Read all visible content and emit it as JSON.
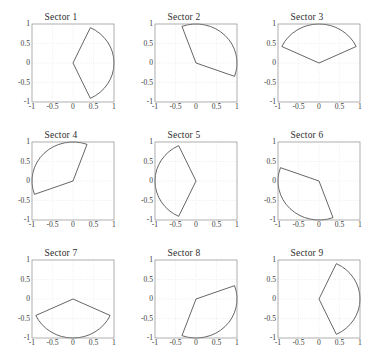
{
  "figure": {
    "background_color": "#ffffff",
    "axis_color": "#8c8c8c",
    "grid_color": "#cfcfcf",
    "curve_color": "#333333",
    "tick_label_color": "#3c3c3c",
    "rows": 3,
    "cols": 3
  },
  "axis": {
    "xticks": [
      "-1",
      "-0.5",
      "0",
      "0.5",
      "1"
    ],
    "yticks": [
      "1",
      "0.5",
      "0",
      "-0.5",
      "-1"
    ],
    "xlim": [
      -1,
      1
    ],
    "ylim": [
      -1,
      1
    ],
    "grid": true
  },
  "chart_data": {
    "type": "line",
    "title": "",
    "xlabel": "",
    "ylabel": "",
    "xlim": [
      -1,
      1
    ],
    "ylim": [
      -1,
      1
    ],
    "grid": true,
    "xticks": [
      -1,
      -0.5,
      0,
      0.5,
      1
    ],
    "yticks": [
      -1,
      -0.5,
      0,
      0.5,
      1
    ],
    "panels": [
      {
        "title": "Sector 1",
        "apex": [
          0,
          0
        ],
        "radius": 1,
        "start_angle_deg": -65,
        "end_angle_deg": 65,
        "arc_end_points": [
          [
            0.42,
            0.91
          ],
          [
            0.42,
            -0.91
          ]
        ],
        "values": [
          [
            0,
            0
          ],
          [
            0.42,
            0.91
          ],
          [
            1,
            0
          ],
          [
            0.42,
            -0.91
          ],
          [
            0,
            0
          ]
        ]
      },
      {
        "title": "Sector 2",
        "apex": [
          0,
          0
        ],
        "radius": 1,
        "start_angle_deg": -20,
        "end_angle_deg": 110,
        "arc_end_points": [
          [
            0.94,
            -0.34
          ],
          [
            -0.34,
            0.94
          ]
        ],
        "values": [
          [
            0,
            0
          ],
          [
            -0.34,
            0.94
          ],
          [
            0.5,
            0.87
          ],
          [
            0.94,
            -0.34
          ],
          [
            0,
            0
          ]
        ]
      },
      {
        "title": "Sector 3",
        "apex": [
          0,
          0
        ],
        "radius": 1,
        "start_angle_deg": 25,
        "end_angle_deg": 155,
        "arc_end_points": [
          [
            0.91,
            0.42
          ],
          [
            -0.91,
            0.42
          ]
        ],
        "values": [
          [
            0,
            0
          ],
          [
            0.91,
            0.42
          ],
          [
            0,
            1
          ],
          [
            -0.91,
            0.42
          ],
          [
            0,
            0
          ]
        ]
      },
      {
        "title": "Sector 4",
        "apex": [
          0,
          0
        ],
        "radius": 1,
        "start_angle_deg": 70,
        "end_angle_deg": 200,
        "arc_end_points": [
          [
            0.34,
            0.94
          ],
          [
            -0.94,
            -0.34
          ]
        ],
        "values": [
          [
            0,
            0
          ],
          [
            0.34,
            0.94
          ],
          [
            -0.5,
            0.87
          ],
          [
            -0.94,
            -0.34
          ],
          [
            0,
            0
          ]
        ]
      },
      {
        "title": "Sector 5",
        "apex": [
          0,
          0
        ],
        "radius": 1,
        "start_angle_deg": 115,
        "end_angle_deg": 245,
        "arc_end_points": [
          [
            -0.42,
            0.91
          ],
          [
            -0.42,
            -0.91
          ]
        ],
        "values": [
          [
            0,
            0
          ],
          [
            -0.42,
            0.91
          ],
          [
            -1,
            0
          ],
          [
            -0.42,
            -0.91
          ],
          [
            0,
            0
          ]
        ]
      },
      {
        "title": "Sector 6",
        "apex": [
          0,
          0
        ],
        "radius": 1,
        "start_angle_deg": 160,
        "end_angle_deg": 290,
        "arc_end_points": [
          [
            -0.94,
            0.34
          ],
          [
            0.34,
            -0.94
          ]
        ],
        "values": [
          [
            0,
            0
          ],
          [
            -0.94,
            0.34
          ],
          [
            -0.87,
            -0.5
          ],
          [
            0.34,
            -0.94
          ],
          [
            0,
            0
          ]
        ]
      },
      {
        "title": "Sector 7",
        "apex": [
          0,
          0
        ],
        "radius": 1,
        "start_angle_deg": 205,
        "end_angle_deg": 335,
        "arc_end_points": [
          [
            -0.91,
            -0.42
          ],
          [
            0.91,
            -0.42
          ]
        ],
        "values": [
          [
            0,
            0
          ],
          [
            -0.91,
            -0.42
          ],
          [
            0,
            -1
          ],
          [
            0.91,
            -0.42
          ],
          [
            0,
            0
          ]
        ]
      },
      {
        "title": "Sector 8",
        "apex": [
          0,
          0
        ],
        "radius": 1,
        "start_angle_deg": 250,
        "end_angle_deg": 380,
        "arc_end_points": [
          [
            -0.34,
            -0.94
          ],
          [
            0.94,
            0.34
          ]
        ],
        "values": [
          [
            0,
            0
          ],
          [
            -0.34,
            -0.94
          ],
          [
            0.5,
            -0.87
          ],
          [
            0.94,
            0.34
          ],
          [
            0,
            0
          ]
        ]
      },
      {
        "title": "Sector 9",
        "apex": [
          0,
          0
        ],
        "radius": 1,
        "start_angle_deg": 295,
        "end_angle_deg": 425,
        "arc_end_points": [
          [
            0.42,
            -0.91
          ],
          [
            0.42,
            0.91
          ]
        ],
        "values": [
          [
            0,
            0
          ],
          [
            0.42,
            -0.91
          ],
          [
            1,
            0
          ],
          [
            0.42,
            0.91
          ],
          [
            0,
            0
          ]
        ]
      }
    ]
  }
}
